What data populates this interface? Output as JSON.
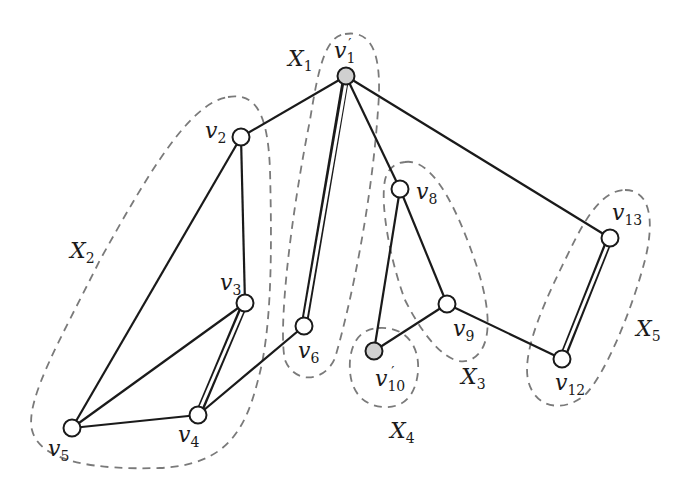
{
  "diagram": {
    "colors": {
      "edge": "#1a1a1a",
      "cluster": "#7a7a7a",
      "node_fill": "#ffffff",
      "shaded_node_fill": "#d0d0d0",
      "background": "#ffffff"
    },
    "nodes": [
      {
        "id": "v1p",
        "base": "v",
        "sub": "1",
        "prime": "′",
        "x": 346,
        "y": 76,
        "shaded": true
      },
      {
        "id": "v2",
        "base": "v",
        "sub": "2",
        "prime": "",
        "x": 241,
        "y": 137,
        "shaded": false
      },
      {
        "id": "v3",
        "base": "v",
        "sub": "3",
        "prime": "",
        "x": 245,
        "y": 303,
        "shaded": false
      },
      {
        "id": "v4",
        "base": "v",
        "sub": "4",
        "prime": "",
        "x": 198,
        "y": 415,
        "shaded": false
      },
      {
        "id": "v5",
        "base": "v",
        "sub": "5",
        "prime": "",
        "x": 72,
        "y": 428,
        "shaded": false
      },
      {
        "id": "v6",
        "base": "v",
        "sub": "6",
        "prime": "",
        "x": 304,
        "y": 326,
        "shaded": false
      },
      {
        "id": "v8",
        "base": "v",
        "sub": "8",
        "prime": "",
        "x": 400,
        "y": 189,
        "shaded": false
      },
      {
        "id": "v9",
        "base": "v",
        "sub": "9",
        "prime": "",
        "x": 447,
        "y": 304,
        "shaded": false
      },
      {
        "id": "v10p",
        "base": "v",
        "sub": "10",
        "prime": "′",
        "x": 374,
        "y": 351,
        "shaded": true
      },
      {
        "id": "v12",
        "base": "v",
        "sub": "12",
        "prime": "",
        "x": 562,
        "y": 359,
        "shaded": false
      },
      {
        "id": "v13",
        "base": "v",
        "sub": "13",
        "prime": "",
        "x": 610,
        "y": 238,
        "shaded": false
      }
    ],
    "edges": [
      {
        "from": "v1p",
        "to": "v2",
        "double": false
      },
      {
        "from": "v1p",
        "to": "v6",
        "double": true
      },
      {
        "from": "v1p",
        "to": "v8",
        "double": false
      },
      {
        "from": "v1p",
        "to": "v13",
        "double": false
      },
      {
        "from": "v2",
        "to": "v3",
        "double": false
      },
      {
        "from": "v2",
        "to": "v5",
        "double": false
      },
      {
        "from": "v3",
        "to": "v4",
        "double": true
      },
      {
        "from": "v3",
        "to": "v5",
        "double": false
      },
      {
        "from": "v4",
        "to": "v5",
        "double": false
      },
      {
        "from": "v4",
        "to": "v6",
        "double": false
      },
      {
        "from": "v8",
        "to": "v9",
        "double": false
      },
      {
        "from": "v8",
        "to": "v10p",
        "double": false
      },
      {
        "from": "v9",
        "to": "v10p",
        "double": false
      },
      {
        "from": "v9",
        "to": "v12",
        "double": false
      },
      {
        "from": "v12",
        "to": "v13",
        "double": true
      }
    ],
    "clusters": [
      {
        "id": "X1",
        "base": "X",
        "sub": "1",
        "label_x": 288,
        "label_y": 72
      },
      {
        "id": "X2",
        "base": "X",
        "sub": "2",
        "label_x": 70,
        "label_y": 262
      },
      {
        "id": "X3",
        "base": "X",
        "sub": "3",
        "label_x": 461,
        "label_y": 388
      },
      {
        "id": "X4",
        "base": "X",
        "sub": "4",
        "label_x": 390,
        "label_y": 443
      },
      {
        "id": "X5",
        "base": "X",
        "sub": "5",
        "label_x": 636,
        "label_y": 340
      }
    ]
  }
}
